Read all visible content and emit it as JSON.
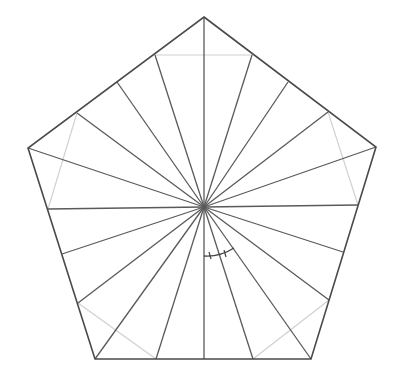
{
  "diagram": {
    "type": "pentagon-dissection",
    "colors": {
      "outline": "#4a4a4a",
      "spoke": "#5a5a5a",
      "chord": "#cfcfcf",
      "mark": "#444444",
      "background": "#ffffff"
    },
    "center": [
      204,
      207
    ],
    "vertices": [
      [
        204,
        17
      ],
      [
        376,
        147
      ],
      [
        311,
        359
      ],
      [
        95,
        359
      ],
      [
        28,
        148
      ]
    ],
    "spoke_endpoints": [
      [
        204,
        17
      ],
      [
        252,
        55
      ],
      [
        288,
        82
      ],
      [
        328,
        112
      ],
      [
        376,
        147
      ],
      [
        358,
        205
      ],
      [
        343,
        252
      ],
      [
        329,
        300
      ],
      [
        311,
        359
      ],
      [
        253,
        359
      ],
      [
        204,
        359
      ],
      [
        156,
        359
      ],
      [
        95,
        359
      ],
      [
        78,
        303
      ],
      [
        62,
        254
      ],
      [
        48,
        209
      ],
      [
        28,
        148
      ],
      [
        77,
        113
      ],
      [
        117,
        82
      ],
      [
        155,
        55
      ]
    ],
    "chords": [
      [
        [
          155,
          55
        ],
        [
          252,
          55
        ]
      ],
      [
        [
          328,
          112
        ],
        [
          358,
          205
        ]
      ],
      [
        [
          329,
          300
        ],
        [
          253,
          359
        ]
      ],
      [
        [
          156,
          359
        ],
        [
          78,
          303
        ]
      ],
      [
        [
          48,
          209
        ],
        [
          77,
          113
        ]
      ]
    ],
    "angle_mark": {
      "arc_path": "M 204 256 Q 220 257 234 248",
      "ticks": [
        [
          [
            209,
            252
          ],
          [
            211,
            259
          ]
        ],
        [
          [
            224,
            250
          ],
          [
            226,
            257
          ]
        ]
      ]
    }
  }
}
